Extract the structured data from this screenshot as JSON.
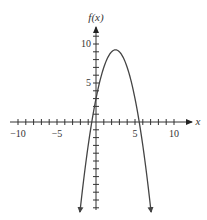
{
  "chart_data": {
    "type": "line",
    "title": "",
    "xlabel": "x",
    "ylabel": "f(x)",
    "function": "f(x) = -x^2 + 5x + 3",
    "xlim": [
      -10,
      10
    ],
    "ylim": [
      -11,
      11
    ],
    "x_tick_labels": [
      "-10",
      "-5",
      "5",
      "10"
    ],
    "x_tick_values": [
      -10,
      -5,
      5,
      10
    ],
    "y_tick_labels": [
      "5",
      "10"
    ],
    "y_tick_values": [
      5,
      10
    ],
    "minor_tick_step": 1,
    "grid": false,
    "legend": null,
    "series": [
      {
        "name": "f(x)",
        "x": [
          -2.06,
          -1,
          0,
          1,
          2,
          2.5,
          3,
          4,
          5,
          6,
          7.06
        ],
        "y": [
          -11.5,
          -3,
          3,
          7,
          9,
          9.25,
          9,
          7,
          3,
          -3,
          -11.5
        ]
      }
    ],
    "annotations": [
      "Arrowheads at both ends of the curve indicate it continues downward",
      "Vertex near (2.5, 9.25)",
      "Zeros near x ≈ -0.5 and x ≈ 5.5"
    ]
  },
  "axes": {
    "x_label": "x",
    "y_label": "f(x)",
    "tick_labels": {
      "x_neg10": "−10",
      "x_neg5": "−5",
      "x_5": "5",
      "x_10": "10",
      "y_5": "5",
      "y_10": "10"
    }
  },
  "colors": {
    "axis": "#333333",
    "curve": "#444444"
  }
}
